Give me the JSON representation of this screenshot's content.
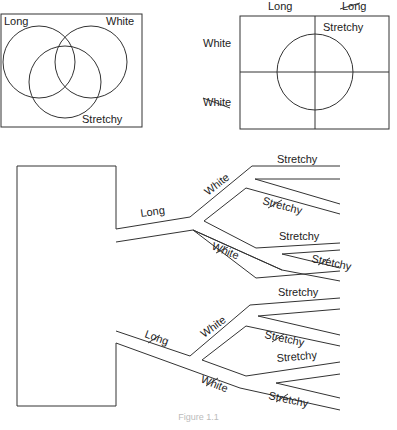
{
  "venn": {
    "labels": {
      "long": "Long",
      "white": "White",
      "stretchy": "Stretchy"
    }
  },
  "grid": {
    "columns": [
      "Long",
      "Long"
    ],
    "column_negated": [
      false,
      true
    ],
    "rows": [
      "White",
      "White"
    ],
    "row_negated": [
      false,
      true
    ],
    "circle_label": "Stretchy"
  },
  "tree": {
    "level1": [
      {
        "label": "Long",
        "negated": false
      },
      {
        "label": "Long",
        "negated": true
      }
    ],
    "level2_label": "White",
    "level3_label": "Stretchy",
    "leaf_pattern": [
      "Stretchy",
      "Stretchy (negated)"
    ]
  },
  "caption": "Figure 1.1"
}
